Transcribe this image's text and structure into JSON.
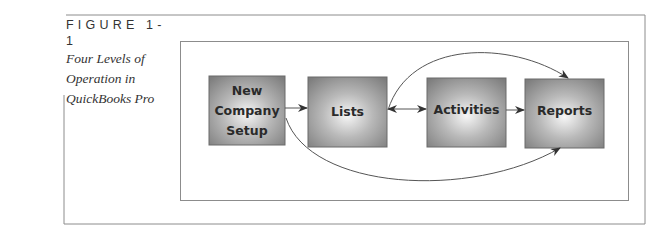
{
  "figure": {
    "number": "FIGURE 1-1",
    "title_lines": [
      "Four Levels of",
      "Operation in",
      "QuickBooks Pro"
    ]
  },
  "diagram": {
    "boxes": [
      {
        "id": "new-company-setup",
        "label_lines": [
          "New",
          "Company",
          "Setup"
        ]
      },
      {
        "id": "lists",
        "label_lines": [
          "Lists"
        ]
      },
      {
        "id": "activities",
        "label_lines": [
          "Activities"
        ]
      },
      {
        "id": "reports",
        "label_lines": [
          "Reports"
        ]
      }
    ],
    "connections": [
      {
        "from": "new-company-setup",
        "to": "lists",
        "type": "straight-arrow"
      },
      {
        "from": "lists",
        "to": "activities",
        "type": "double-arrow"
      },
      {
        "from": "activities",
        "to": "reports",
        "type": "straight-arrow"
      },
      {
        "from": "lists",
        "to": "reports",
        "type": "curved-arrow-over"
      },
      {
        "from": "new-company-setup",
        "to": "reports",
        "type": "curved-arrow-under"
      }
    ],
    "colors": {
      "box_edge": "#7a7a7a",
      "box_center": "#f4f4f4",
      "line": "#555555",
      "frame": "#8c8c8c"
    }
  }
}
